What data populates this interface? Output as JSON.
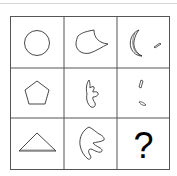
{
  "puzzle": {
    "rows": 3,
    "cols": 3,
    "colors": {
      "stroke": "#333333",
      "grid": "#555555",
      "top_rule": "#d6d6d6"
    },
    "cells": [
      {
        "row": 0,
        "col": 0,
        "shape": "circle"
      },
      {
        "row": 0,
        "col": 1,
        "shape": "teardrop-curved"
      },
      {
        "row": 0,
        "col": 2,
        "shape": "crescent-plus-sliver"
      },
      {
        "row": 1,
        "col": 0,
        "shape": "pentagon"
      },
      {
        "row": 1,
        "col": 1,
        "shape": "hook-blob"
      },
      {
        "row": 1,
        "col": 2,
        "shape": "two-slivers"
      },
      {
        "row": 2,
        "col": 0,
        "shape": "triangle"
      },
      {
        "row": 2,
        "col": 1,
        "shape": "claw-blob"
      },
      {
        "row": 2,
        "col": 2,
        "shape": "question-mark"
      }
    ],
    "answer_placeholder": "?"
  }
}
